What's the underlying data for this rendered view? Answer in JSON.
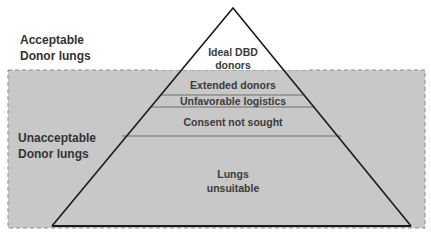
{
  "colors": {
    "background": "#ffffff",
    "unacceptable_region": "#c8c8c8",
    "dash_border": "#8a8a8a",
    "triangle_fill": "#c8c8c8",
    "triangle_stroke": "#1a1a1a",
    "divider": "#6e6e6e",
    "text": "#3a3a3a"
  },
  "regions": {
    "acceptable": {
      "line1": "Acceptable",
      "line2": "Donor lungs"
    },
    "unacceptable": {
      "line1": "Unacceptable",
      "line2": "Donor lungs"
    }
  },
  "pyramid": {
    "tiers": [
      {
        "line1": "Ideal DBD",
        "line2": "donors"
      },
      {
        "line1": "Extended donors"
      },
      {
        "line1": "Unfavorable logistics"
      },
      {
        "line1": "Consent not sought"
      },
      {
        "line1": "Lungs",
        "line2": "unsuitable"
      }
    ]
  }
}
